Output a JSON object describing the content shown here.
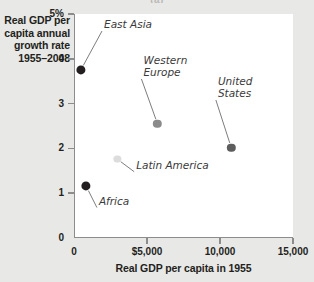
{
  "figure": {
    "caption": "(a)",
    "background_color": "#e8e8e6",
    "plot_background_color": "#ffffff",
    "axis_color": "#8c8c8c"
  },
  "chart_data": {
    "type": "scatter",
    "title": "(a)",
    "xlabel": "Real GDP per capita in 1955",
    "ylabel": "Real GDP per capita annual growth rate 1955–2008",
    "xlim": [
      0,
      15000
    ],
    "ylim": [
      0,
      5
    ],
    "grid": false,
    "legend": "none",
    "xticks": [
      {
        "value": 0,
        "label": "0"
      },
      {
        "value": 5000,
        "label": "$5,000"
      },
      {
        "value": 10000,
        "label": "10,000"
      },
      {
        "value": 15000,
        "label": "15,000"
      }
    ],
    "yticks": [
      {
        "value": 0,
        "label": "0"
      },
      {
        "value": 1,
        "label": "1"
      },
      {
        "value": 2,
        "label": "2"
      },
      {
        "value": 3,
        "label": "3"
      },
      {
        "value": 4,
        "label": "4"
      },
      {
        "value": 5,
        "label": "5%"
      }
    ],
    "points": [
      {
        "name": "East Asia",
        "label": "East Asia",
        "x": 400,
        "y": 3.75,
        "color": "#231f20",
        "radius": 4.6,
        "label_x": 1850,
        "label_y": 4.62,
        "label_align": "left",
        "label_lines": [
          "East Asia"
        ]
      },
      {
        "name": "Western Europe",
        "label": "Western Europe",
        "x": 5650,
        "y": 2.55,
        "color": "#8b8b8b",
        "radius": 4.2,
        "label_x": 4550,
        "label_y": 3.55,
        "label_align": "left",
        "label_lines": [
          "Western",
          "Europe"
        ]
      },
      {
        "name": "United States",
        "label": "United States",
        "x": 10700,
        "y": 2.02,
        "color": "#5d5d5d",
        "radius": 4.2,
        "label_x": 9650,
        "label_y": 3.08,
        "label_align": "left",
        "label_lines": [
          "United",
          "States"
        ]
      },
      {
        "name": "Latin America",
        "label": "Latin America",
        "x": 2900,
        "y": 1.76,
        "color": "#dcdcdc",
        "radius": 3.6,
        "label_x": 4050,
        "label_y": 1.48,
        "label_align": "left",
        "label_lines": [
          "Latin America"
        ]
      },
      {
        "name": "Africa",
        "label": "Africa",
        "x": 760,
        "y": 1.16,
        "color": "#231f20",
        "radius": 4.6,
        "label_x": 1500,
        "label_y": 0.68,
        "label_align": "left",
        "label_lines": [
          "Africa"
        ]
      }
    ]
  }
}
